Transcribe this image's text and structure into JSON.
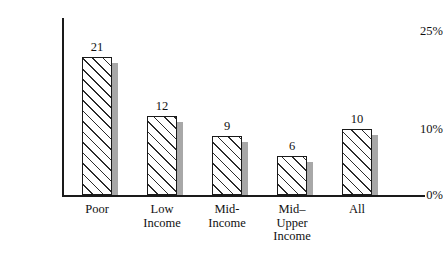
{
  "chart_data": {
    "type": "bar",
    "title": "",
    "subtitle": "",
    "xlabel": "",
    "ylabel": "",
    "categories": [
      "Poor",
      "Low\nIncome",
      "Mid-\nIncome",
      "Mid–\nUpper\nIncome",
      "All"
    ],
    "values": [
      21,
      12,
      9,
      6,
      10
    ],
    "value_labels": [
      "21",
      "12",
      "9",
      "6",
      "10"
    ],
    "ylim": [
      0,
      25
    ],
    "ytick_values": [
      25,
      10,
      0
    ],
    "ytick_labels": [
      "25%",
      "10%",
      "0%"
    ],
    "grid": false,
    "legend": false,
    "series": [
      {
        "name": "",
        "values": [
          21,
          12,
          9,
          6,
          10
        ]
      }
    ],
    "style": {
      "bar_fill": "#ffffff",
      "bar_hatch": "diagonal",
      "bar_border": "#1a1a1a",
      "bar_shadow": "#a8a8a8",
      "axis_color": "#1a1a1a",
      "text_color": "#111111",
      "background": "#ffffff"
    }
  }
}
